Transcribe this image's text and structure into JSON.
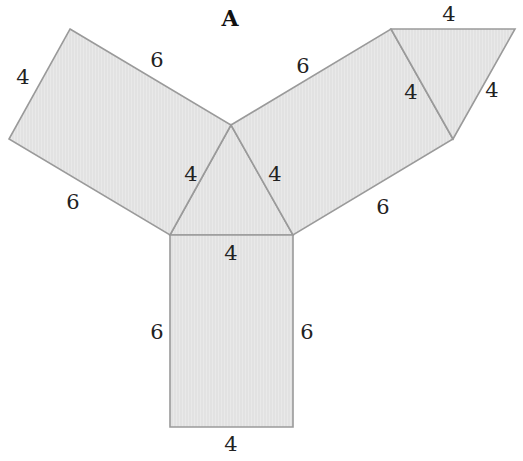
{
  "title": "A",
  "colors": {
    "fill": "#e6e6e6",
    "stroke": "#9a9a9a",
    "text": "#222222"
  },
  "net": {
    "description": "Net of a triangular prism: equilateral triangle base with side 4, three rectangular faces 4 by 6, and a second triangular face of side 4",
    "faces": [
      {
        "id": "center-triangle",
        "type": "triangle",
        "points": [
          [
            231,
            125
          ],
          [
            170,
            235
          ],
          [
            293,
            235
          ]
        ]
      },
      {
        "id": "left-rectangle",
        "type": "rectangle",
        "points": [
          [
            70,
            29
          ],
          [
            231,
            125
          ],
          [
            170,
            235
          ],
          [
            9,
            139
          ]
        ]
      },
      {
        "id": "right-rectangle",
        "type": "rectangle",
        "points": [
          [
            231,
            125
          ],
          [
            391,
            29
          ],
          [
            453,
            139
          ],
          [
            293,
            235
          ]
        ]
      },
      {
        "id": "bottom-rectangle",
        "type": "rectangle",
        "points": [
          [
            170,
            235
          ],
          [
            293,
            235
          ],
          [
            293,
            427
          ],
          [
            170,
            427
          ]
        ]
      },
      {
        "id": "top-right-triangle",
        "type": "triangle",
        "points": [
          [
            391,
            29
          ],
          [
            515,
            29
          ],
          [
            453,
            139
          ]
        ]
      }
    ]
  },
  "labels": [
    {
      "id": "left-rect-top",
      "text": "6",
      "x": 157,
      "y": 60
    },
    {
      "id": "left-rect-left",
      "text": "4",
      "x": 23,
      "y": 77
    },
    {
      "id": "left-rect-bottom",
      "text": "6",
      "x": 73,
      "y": 202
    },
    {
      "id": "tri-left",
      "text": "4",
      "x": 191,
      "y": 174
    },
    {
      "id": "tri-right",
      "text": "4",
      "x": 275,
      "y": 174
    },
    {
      "id": "tri-bottom",
      "text": "4",
      "x": 231,
      "y": 253
    },
    {
      "id": "right-rect-top",
      "text": "6",
      "x": 303,
      "y": 66
    },
    {
      "id": "right-rect-inner",
      "text": "4",
      "x": 411,
      "y": 92
    },
    {
      "id": "right-rect-bottom",
      "text": "6",
      "x": 383,
      "y": 207
    },
    {
      "id": "top-tri-top",
      "text": "4",
      "x": 449,
      "y": 14
    },
    {
      "id": "top-tri-right",
      "text": "4",
      "x": 492,
      "y": 90
    },
    {
      "id": "bottom-rect-left",
      "text": "6",
      "x": 157,
      "y": 332
    },
    {
      "id": "bottom-rect-right",
      "text": "6",
      "x": 307,
      "y": 332
    },
    {
      "id": "bottom-rect-bottom",
      "text": "4",
      "x": 231,
      "y": 444
    }
  ]
}
